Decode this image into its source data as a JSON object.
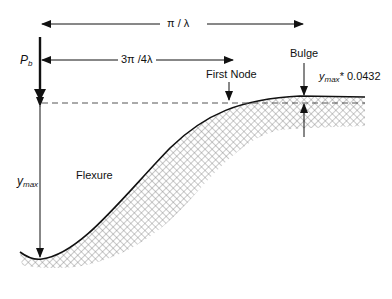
{
  "diagram": {
    "labels": {
      "wavelength": "π / λ",
      "first_node_distance": "3π /4λ",
      "load": {
        "main": "P",
        "sub": "b"
      },
      "ymax": {
        "main": "y",
        "sub": "max"
      },
      "flexure": "Flexure",
      "first_node": "First Node",
      "bulge": "Bulge",
      "bulge_height": {
        "main": "y",
        "sub": "max",
        "suffix": "* 0.0432"
      }
    },
    "colors": {
      "line": "#111111",
      "dashed": "#555555",
      "hatch": "#888888",
      "background": "#ffffff"
    }
  }
}
